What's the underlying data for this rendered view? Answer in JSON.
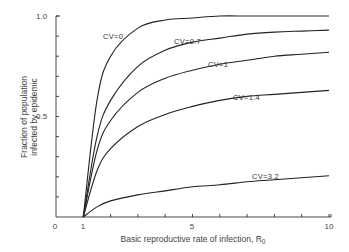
{
  "chart_data": {
    "type": "line",
    "title": "",
    "xlabel": "Basic reproductive rate of infection, R",
    "xlabel_subscript": "0",
    "ylabel_line1": "Fraction of population",
    "ylabel_line2": "infected by epidemic",
    "xlim": [
      0,
      10
    ],
    "ylim": [
      0,
      1.0
    ],
    "x_ticks": [
      0,
      1,
      5,
      10
    ],
    "x_tick_labels": [
      "0",
      "1",
      "5",
      "10"
    ],
    "y_ticks": [
      0.5,
      1.0
    ],
    "y_tick_labels": [
      "0.5",
      "1.0"
    ],
    "grid": false,
    "legend": "inline curve labels",
    "x": [
      1,
      1.5,
      2,
      3,
      4,
      5,
      6,
      7,
      8,
      9,
      10
    ],
    "series": [
      {
        "name": "CV=0",
        "label": "CV=0",
        "values": [
          0,
          0.58,
          0.8,
          0.94,
          0.98,
          0.99,
          1.0,
          1.0,
          1.0,
          1.0,
          1.0
        ]
      },
      {
        "name": "CV=0.7",
        "label": "CV=0.7",
        "values": [
          0,
          0.4,
          0.58,
          0.75,
          0.83,
          0.87,
          0.89,
          0.91,
          0.92,
          0.925,
          0.93
        ]
      },
      {
        "name": "CV=1",
        "label": "CV=1",
        "values": [
          0,
          0.33,
          0.48,
          0.62,
          0.69,
          0.73,
          0.76,
          0.78,
          0.8,
          0.81,
          0.82
        ]
      },
      {
        "name": "CV=1.4",
        "label": "CV=1.4",
        "values": [
          0,
          0.23,
          0.34,
          0.45,
          0.51,
          0.55,
          0.58,
          0.6,
          0.61,
          0.62,
          0.63
        ]
      },
      {
        "name": "CV=3.2",
        "label": "CV=3.2",
        "values": [
          0,
          0.05,
          0.08,
          0.11,
          0.13,
          0.15,
          0.16,
          0.175,
          0.185,
          0.195,
          0.205
        ]
      }
    ]
  }
}
